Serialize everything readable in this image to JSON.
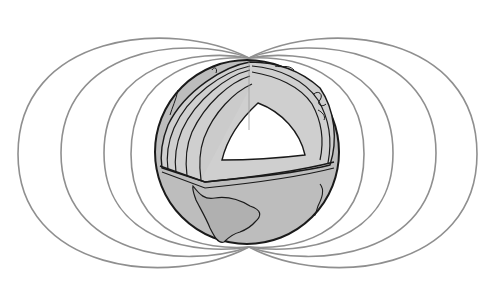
{
  "figure": {
    "subject": "Earth magnetic field with cutaway globe",
    "colors": {
      "background": "#ffffff",
      "field_line": "#8f8f8f",
      "globe_fill": "#bdbdbd",
      "globe_outline": "#1a1a1a",
      "mantle_fill": "#cfcfcf",
      "layer_fill": "#c4c4c4",
      "core_fill": "#ffffff",
      "continent_fill": "#b0b0b0"
    },
    "globe": {
      "cx": 247,
      "cy": 152,
      "r": 92
    },
    "poles": {
      "north": [
        249,
        58
      ],
      "south": [
        249,
        247
      ]
    },
    "field_lines": [
      {
        "side": "left",
        "extreme_x": 18,
        "top_y": 19,
        "bottom_y": 287
      },
      {
        "side": "left",
        "extreme_x": 61,
        "top_y": 35,
        "bottom_y": 269
      },
      {
        "side": "left",
        "extreme_x": 104,
        "top_y": 49,
        "bottom_y": 255
      },
      {
        "side": "left",
        "extreme_x": 131,
        "top_y": 56,
        "bottom_y": 250
      },
      {
        "side": "right",
        "extreme_x": 364,
        "top_y": 56,
        "bottom_y": 250
      },
      {
        "side": "right",
        "extreme_x": 393,
        "top_y": 49,
        "bottom_y": 255
      },
      {
        "side": "right",
        "extreme_x": 436,
        "top_y": 35,
        "bottom_y": 269
      },
      {
        "side": "right",
        "extreme_x": 477,
        "top_y": 19,
        "bottom_y": 287
      }
    ],
    "layers_visible": [
      "crust",
      "upper mantle",
      "lower mantle",
      "outer core",
      "inner core"
    ],
    "continent_visible": "South America"
  }
}
